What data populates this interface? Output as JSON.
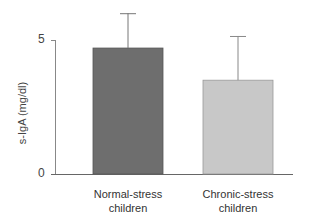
{
  "chart_data": {
    "type": "bar",
    "title": "",
    "xlabel": "",
    "ylabel": "s-IgA (mg/dl)",
    "ylim": [
      0,
      5
    ],
    "yticks": [
      0,
      5
    ],
    "grid": false,
    "legend": null,
    "categories": [
      "Normal-stress children",
      "Chronic-stress children"
    ],
    "values": [
      4.7,
      3.5
    ],
    "error_bars_upper": [
      1.3,
      1.65
    ],
    "bar_colors": [
      "#6e6e6e",
      "#c8c8c8"
    ]
  },
  "axis": {
    "y_label": "s-IgA (mg/dl)",
    "tick_0": "0",
    "tick_5": "5"
  },
  "labels": {
    "bar1_line1": "Normal-stress",
    "bar1_line2": "children",
    "bar2_line1": "Chronic-stress",
    "bar2_line2": "children"
  }
}
